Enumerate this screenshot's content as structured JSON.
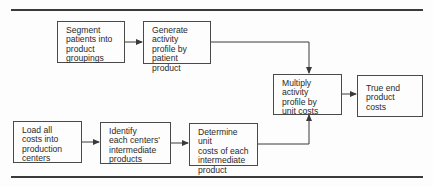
{
  "diagram": {
    "nodes": [
      {
        "id": "segment",
        "label": "Segment\npatients into\nproduct\ngroupings"
      },
      {
        "id": "generate",
        "label": "Generate\nactivity\nprofile by\npatient product"
      },
      {
        "id": "multiply",
        "label": "Multiply\nactivity\nprofile by\nunit costs"
      },
      {
        "id": "true-end",
        "label": "True end\nproduct\ncosts"
      },
      {
        "id": "load",
        "label": "Load all\ncosts into\nproduction\ncenters"
      },
      {
        "id": "identify",
        "label": "Identify\neach centers'\nintermediate\nproducts"
      },
      {
        "id": "determine",
        "label": "Determine unit\ncosts of each\nintermediate\nproduct"
      }
    ],
    "edges": [
      {
        "from": "segment",
        "to": "generate"
      },
      {
        "from": "generate",
        "to": "multiply"
      },
      {
        "from": "multiply",
        "to": "true-end"
      },
      {
        "from": "load",
        "to": "identify"
      },
      {
        "from": "identify",
        "to": "determine"
      },
      {
        "from": "determine",
        "to": "multiply"
      }
    ],
    "colors": {
      "line": "#3a3a3a",
      "box_border": "#4a4a4a",
      "text": "#2a2a2a"
    }
  }
}
